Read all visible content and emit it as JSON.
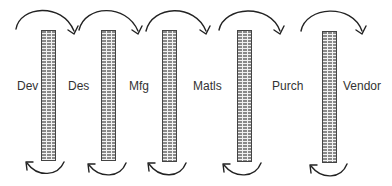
{
  "diagram": {
    "departments": [
      {
        "label": "Dev",
        "x": 17
      },
      {
        "label": "Des",
        "x": 68
      },
      {
        "label": "Mfg",
        "x": 129
      },
      {
        "label": "Matls",
        "x": 193
      },
      {
        "label": "Purch",
        "x": 272
      },
      {
        "label": "Vendor",
        "x": 343
      }
    ],
    "walls": [
      {
        "x": 41,
        "top": 30,
        "bottom": 161
      },
      {
        "x": 101,
        "top": 30,
        "bottom": 161
      },
      {
        "x": 162,
        "top": 30,
        "bottom": 162
      },
      {
        "x": 237,
        "top": 30,
        "bottom": 162
      },
      {
        "x": 322,
        "top": 31,
        "bottom": 163
      }
    ],
    "forward_arrows": [
      {
        "from": "Dev",
        "to": "Des",
        "icon": "curved-arrow-right-icon"
      },
      {
        "from": "Des",
        "to": "Mfg",
        "icon": "curved-arrow-right-icon"
      },
      {
        "from": "Mfg",
        "to": "Matls",
        "icon": "curved-arrow-right-icon"
      },
      {
        "from": "Matls",
        "to": "Purch",
        "icon": "curved-arrow-right-icon"
      },
      {
        "from": "Purch",
        "to": "Vendor",
        "icon": "curved-arrow-right-icon"
      }
    ],
    "return_arrows": [
      {
        "under_wall": 1,
        "icon": "curved-arrow-left-icon"
      },
      {
        "under_wall": 2,
        "icon": "curved-arrow-left-icon"
      },
      {
        "under_wall": 3,
        "icon": "curved-arrow-left-icon"
      },
      {
        "under_wall": 4,
        "icon": "curved-arrow-left-icon"
      },
      {
        "under_wall": 5,
        "icon": "curved-arrow-left-icon"
      }
    ],
    "colors": {
      "stroke": "#222222",
      "brick": "#8a8a8a",
      "mortar": "#f2f2f2",
      "text": "#333333"
    }
  }
}
